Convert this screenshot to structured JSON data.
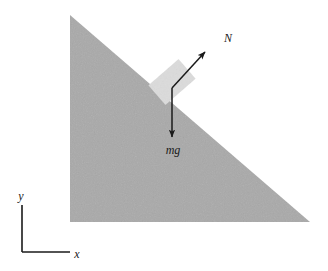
{
  "figure": {
    "kind": "free-body-diagram",
    "caption": "",
    "background_color": "#ffffff"
  },
  "incline": {
    "name": "inclined-plane",
    "shape": "right-triangle",
    "fill_color": "#a9a9a9",
    "apex": [
      70,
      15
    ],
    "bottom_left": [
      70,
      222
    ],
    "bottom_right": [
      310,
      222
    ],
    "angle_degrees": 41
  },
  "block": {
    "name": "block-on-incline",
    "fill_color": "#dcdcdc",
    "center": [
      172,
      82
    ],
    "width": 40,
    "height": 26,
    "rotation_degrees": -41
  },
  "vectors": [
    {
      "id": "normal-force",
      "label": "N",
      "from": [
        172,
        88
      ],
      "to": [
        205,
        52
      ],
      "label_pos": [
        228,
        42
      ],
      "color": "#1a1a1a"
    },
    {
      "id": "weight-force",
      "label": "mg",
      "from": [
        172,
        88
      ],
      "to": [
        172,
        137
      ],
      "label_pos": [
        164,
        152
      ],
      "color": "#1a1a1a"
    }
  ],
  "axes": {
    "name": "coordinate-axes",
    "color": "#1a1a1a",
    "corner": [
      22,
      252
    ],
    "y_tip": [
      22,
      205
    ],
    "x_tip": [
      70,
      252
    ],
    "y_label": "y",
    "x_label": "x",
    "y_label_pos": [
      17,
      201
    ],
    "x_label_pos": [
      74,
      258
    ]
  }
}
